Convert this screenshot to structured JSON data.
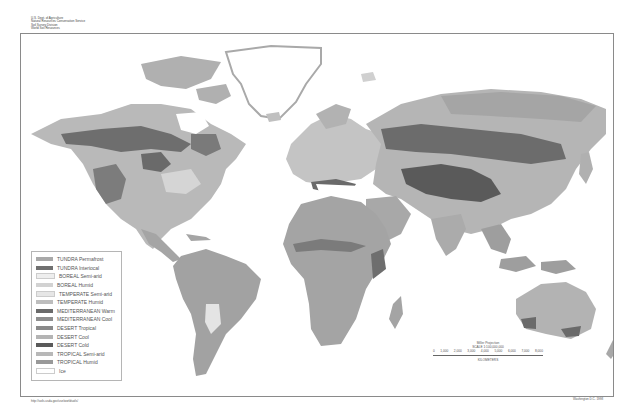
{
  "header": {
    "lines": [
      "U.S. Dept. of Agriculture",
      "Natural Resources Conservation Service",
      "Soil Survey Division",
      "World Soil Resources"
    ]
  },
  "legend": {
    "items": [
      {
        "label": "TUNDRA Permafrost",
        "color": "#a9a9a9"
      },
      {
        "label": "TUNDRA Interiocal",
        "color": "#707070"
      },
      {
        "label": "BOREAL Semi-arid",
        "color": "#eeeeee"
      },
      {
        "label": "BOREAL Humid",
        "color": "#d2d2d2"
      },
      {
        "label": "TEMPERATE Semi-arid",
        "color": "#e6e6e6"
      },
      {
        "label": "TEMPERATE Humid",
        "color": "#bdbdbd"
      },
      {
        "label": "MEDITERRANEAN Warm",
        "color": "#6a6a6a"
      },
      {
        "label": "MEDITERRANEAN Cool",
        "color": "#8e8e8e"
      },
      {
        "label": "DESERT Tropical",
        "color": "#8a8a8a"
      },
      {
        "label": "DESERT Cool",
        "color": "#b4b4b4"
      },
      {
        "label": "DESERT Cold",
        "color": "#5a5a5a"
      },
      {
        "label": "TROPICAL Semi-arid",
        "color": "#b8b8b8"
      },
      {
        "label": "TROPICAL Humid",
        "color": "#999999"
      },
      {
        "label": "Ice",
        "color": "#ffffff"
      }
    ]
  },
  "scale": {
    "projection": "Miller Projection",
    "ratio": "SCALE 1:100,000,000",
    "ticks": [
      "0",
      "1,000",
      "2,000",
      "3,000",
      "4,000",
      "5,000",
      "6,000",
      "7,000",
      "8,000"
    ],
    "unit": "KILOMETERS"
  },
  "footer": {
    "left": "http://soils.usda.gov/use/worldsoils/",
    "right": "Washington D.C. 1998"
  },
  "colors": {
    "ocean": "#ffffff",
    "frame": "#8a8a8a",
    "ice": "#ffffff"
  }
}
